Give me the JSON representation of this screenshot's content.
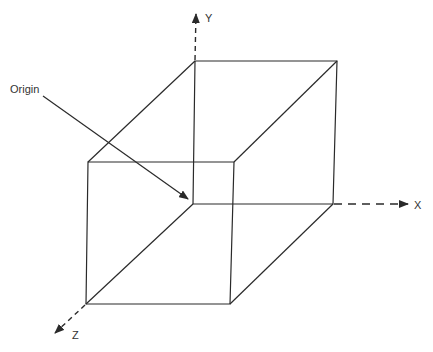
{
  "diagram": {
    "labels": {
      "origin": "Origin",
      "x_axis": "X",
      "y_axis": "Y",
      "z_axis": "Z"
    },
    "colors": {
      "line": "#2a2a2a",
      "text": "#333333",
      "background": "#ffffff"
    }
  }
}
